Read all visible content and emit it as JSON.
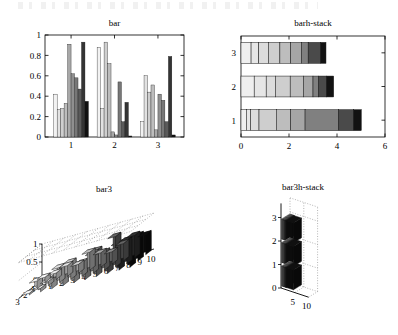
{
  "page": {
    "background": "#ffffff",
    "ink": "#000000",
    "scan_artifact_top": true
  },
  "panels": [
    {
      "id": "bar",
      "title": "bar",
      "position": "top-left"
    },
    {
      "id": "barh-stack",
      "title": "barh-stack",
      "position": "top-right"
    },
    {
      "id": "bar3",
      "title": "bar3",
      "position": "bottom-left"
    },
    {
      "id": "bar3h-stack",
      "title": "bar3h-stack",
      "position": "bottom-right"
    }
  ],
  "chart_data": [
    {
      "id": "bar",
      "type": "bar",
      "title": "bar",
      "xlabel": "",
      "ylabel": "",
      "grid": false,
      "legend": "none",
      "categories": [
        "1",
        "2",
        "3"
      ],
      "xtick_labels": [
        "1",
        "2",
        "3"
      ],
      "ytick_labels": [
        "0",
        "0.2",
        "0.4",
        "0.6",
        "0.8",
        "1"
      ],
      "ylim": [
        0,
        1
      ],
      "xlim": [
        0.4,
        3.6
      ],
      "series_count": 10,
      "series_colors": [
        "#f2f2f2",
        "#e2e2e2",
        "#cfcfcf",
        "#bdbdbd",
        "#a8a8a8",
        "#8f8f8f",
        "#777777",
        "#5a5a5a",
        "#343434",
        "#111111"
      ],
      "groups": [
        {
          "category": "1",
          "values": [
            0.42,
            0.27,
            0.28,
            0.33,
            0.91,
            0.62,
            0.58,
            0.47,
            0.93,
            0.35
          ]
        },
        {
          "category": "2",
          "values": [
            0.88,
            0.28,
            0.93,
            0.72,
            0.05,
            0.02,
            0.54,
            0.15,
            0.34,
            0.01
          ]
        },
        {
          "category": "3",
          "values": [
            0.15,
            0.6,
            0.44,
            0.51,
            0.07,
            0.42,
            0.36,
            0.15,
            0.79,
            0.02
          ]
        }
      ]
    },
    {
      "id": "barh-stack",
      "type": "bar",
      "orientation": "horizontal",
      "stacked": true,
      "title": "barh-stack",
      "xlabel": "",
      "ylabel": "",
      "grid": false,
      "legend": "none",
      "categories": [
        "1",
        "2",
        "3"
      ],
      "ytick_labels": [
        "1",
        "2",
        "3"
      ],
      "xtick_labels": [
        "0",
        "2",
        "4",
        "6"
      ],
      "xlim": [
        0,
        6
      ],
      "series_colors": [
        "#efefef",
        "#e6e6e6",
        "#dcdcdc",
        "#cecece",
        "#bdbdbd",
        "#a6a6a6",
        "#808080",
        "#4a4a4a",
        "#121212"
      ],
      "rows": [
        {
          "category": "1",
          "segments": [
            0.22,
            0.18,
            0.35,
            0.72,
            0.6,
            0.6,
            1.4,
            0.62,
            0.32
          ],
          "total": 5.01
        },
        {
          "category": "2",
          "segments": [
            0.55,
            0.5,
            0.38,
            0.62,
            0.55,
            0.4,
            0.22,
            0.34,
            0.3
          ],
          "total": 3.86
        },
        {
          "category": "3",
          "segments": [
            0.42,
            0.32,
            0.4,
            0.48,
            0.45,
            0.45,
            0.28,
            0.52,
            0.22
          ],
          "total": 3.54
        }
      ]
    },
    {
      "id": "bar3",
      "type": "bar",
      "projection": "3d",
      "title": "bar3",
      "xlabel": "",
      "ylabel": "",
      "zlabel": "",
      "grid": true,
      "legend": "none",
      "xtick_labels": [
        "1",
        "2",
        "3",
        "4",
        "5",
        "6",
        "7",
        "8",
        "9",
        "10"
      ],
      "ytick_labels": [
        "1",
        "2",
        "3"
      ],
      "ztick_labels": [
        "0",
        "0.5",
        "1"
      ],
      "zlim": [
        0,
        1
      ],
      "column_colors": [
        "#ededed",
        "#e2e2e2",
        "#d5d5d5",
        "#c6c6c6",
        "#b4b4b4",
        "#9d9d9d",
        "#818181",
        "#5e5e5e",
        "#2e2e2e",
        "#0d0d0d"
      ],
      "rows": [
        {
          "y": "1",
          "values": [
            0.15,
            0.18,
            0.3,
            0.25,
            0.5,
            0.4,
            0.34,
            0.48,
            0.62,
            0.55
          ]
        },
        {
          "y": "2",
          "values": [
            0.22,
            0.12,
            0.42,
            0.48,
            0.38,
            0.55,
            0.5,
            0.85,
            0.66,
            0.7
          ]
        },
        {
          "y": "3",
          "values": [
            0.05,
            0.1,
            0.35,
            0.3,
            0.45,
            0.38,
            0.72,
            0.55,
            0.74,
            0.68
          ]
        }
      ]
    },
    {
      "id": "bar3h-stack",
      "type": "bar",
      "projection": "3d",
      "orientation": "horizontal",
      "stacked": true,
      "title": "bar3h-stack",
      "xlabel": "",
      "ylabel": "",
      "grid": true,
      "legend": "none",
      "ytick_labels": [
        "0",
        "1",
        "2",
        "3"
      ],
      "xtick_labels": [
        "5",
        "10"
      ],
      "xlim": [
        0,
        10
      ],
      "segment_colors": [
        "#e8e8e8",
        "#d8d8d8",
        "#c6c6c6",
        "#b0b0b0",
        "#959595",
        "#6e6e6e",
        "#3c3c3c",
        "#0f0f0f"
      ],
      "rows": [
        {
          "category": "1",
          "segments": [
            0.3,
            0.28,
            0.26,
            0.25,
            0.24,
            0.22,
            0.2,
            2.6
          ],
          "total": 4.35
        },
        {
          "category": "2",
          "segments": [
            0.3,
            0.28,
            0.26,
            0.25,
            0.24,
            0.22,
            0.2,
            2.6
          ],
          "total": 4.35
        },
        {
          "category": "3",
          "segments": [
            0.3,
            0.28,
            0.26,
            0.25,
            0.24,
            0.22,
            0.2,
            2.6
          ],
          "total": 4.35
        }
      ]
    }
  ]
}
